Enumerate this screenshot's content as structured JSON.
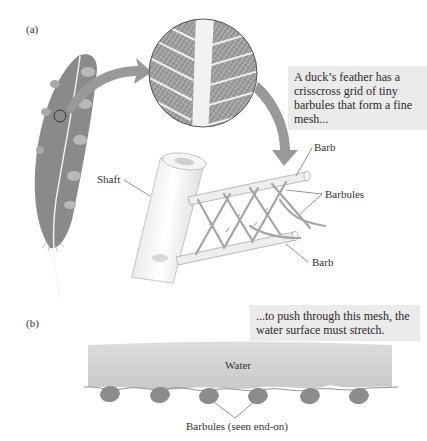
{
  "panel_a": {
    "label": "(a)",
    "callout": "A duck’s feather has a crisscross grid of tiny barbules that form a fine mesh...",
    "labels": {
      "shaft": "Shaft",
      "barb_top": "Barb",
      "barbules": "Barbules",
      "barb_bottom": "Barb"
    }
  },
  "panel_b": {
    "label": "(b)",
    "callout": "...to push through this mesh, the water surface must stretch.",
    "water_label": "Water",
    "barbules_label": "Barbules (seen end-on)",
    "barbule_count": 6
  },
  "colors": {
    "feather": "#8a8a8a",
    "feather_spots": "#b8b8b8",
    "arrow": "#999999",
    "water": "#d4d4d4",
    "barbule_ellipse": "#8c8c8c",
    "callout_bg": "#ebebeb"
  }
}
